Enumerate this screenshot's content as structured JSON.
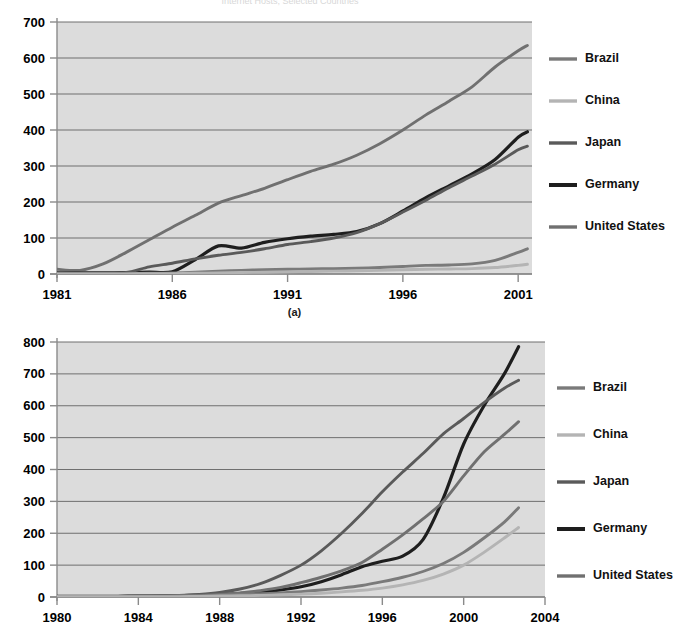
{
  "document": {
    "title_faint": "Internet Hosts, Selected Countries",
    "background_color": "#ffffff",
    "plot_background_color": "#dcdcdc",
    "gridline_color": "#6f6f6f"
  },
  "series_colors": {
    "Brazil": "#7a7a7a",
    "China": "#b4b4b4",
    "Japan": "#5a5a5a",
    "Germany": "#1e1e1e",
    "United States": "#707070"
  },
  "legend": {
    "entries": [
      {
        "label": "Brazil",
        "color": "#7a7a7a"
      },
      {
        "label": "China",
        "color": "#b4b4b4"
      },
      {
        "label": "Japan",
        "color": "#5a5a5a"
      },
      {
        "label": "Germany",
        "color": "#1e1e1e"
      },
      {
        "label": "United States",
        "color": "#707070"
      }
    ]
  },
  "chart_data": [
    {
      "id": "panel-a",
      "type": "line",
      "title": "",
      "caption": "(a)",
      "xlabel": "",
      "ylabel": "",
      "xlim": [
        1981,
        2001.6
      ],
      "ylim": [
        0,
        700
      ],
      "ytick_values": [
        0,
        100,
        200,
        300,
        400,
        500,
        600,
        700
      ],
      "ytick_labels": [
        "0",
        "100",
        "200",
        "300",
        "400",
        "500",
        "600",
        "700"
      ],
      "xtick_values": [
        1981,
        1986,
        1991,
        1996,
        2001
      ],
      "xtick_labels": [
        "1981",
        "1986",
        "1991",
        "1996",
        "2001"
      ],
      "grid": true,
      "legend_position": "right",
      "x": [
        1981,
        1982,
        1983,
        1984,
        1985,
        1986,
        1987,
        1988,
        1989,
        1990,
        1991,
        1992,
        1993,
        1994,
        1995,
        1996,
        1997,
        1998,
        1999,
        2000,
        2001,
        2001.4
      ],
      "series": [
        {
          "name": "United States",
          "color": "#707070",
          "values": [
            13,
            10,
            28,
            60,
            95,
            130,
            163,
            197,
            218,
            238,
            262,
            285,
            305,
            330,
            362,
            400,
            442,
            480,
            520,
            575,
            620,
            635
          ]
        },
        {
          "name": "Germany",
          "color": "#1e1e1e",
          "values": [
            3,
            3,
            3,
            4,
            5,
            6,
            40,
            78,
            72,
            88,
            98,
            105,
            110,
            118,
            140,
            175,
            212,
            245,
            278,
            318,
            380,
            395
          ]
        },
        {
          "name": "Japan",
          "color": "#5a5a5a",
          "values": [
            3,
            3,
            3,
            4,
            20,
            30,
            42,
            52,
            60,
            70,
            82,
            90,
            100,
            115,
            140,
            172,
            205,
            240,
            272,
            305,
            345,
            355
          ]
        },
        {
          "name": "Brazil",
          "color": "#7a7a7a",
          "values": [
            1,
            1,
            1,
            1,
            2,
            3,
            5,
            8,
            10,
            12,
            13,
            14,
            15,
            16,
            18,
            21,
            24,
            25,
            28,
            38,
            60,
            70
          ]
        },
        {
          "name": "China",
          "color": "#b4b4b4",
          "values": [
            0,
            0,
            0,
            0,
            1,
            1,
            2,
            3,
            4,
            5,
            6,
            7,
            8,
            9,
            10,
            12,
            13,
            14,
            15,
            18,
            24,
            27
          ]
        }
      ]
    },
    {
      "id": "panel-b",
      "type": "line",
      "title": "",
      "caption": "",
      "xlabel": "",
      "ylabel": "",
      "xlim": [
        1980,
        2004
      ],
      "ylim": [
        0,
        800
      ],
      "ytick_values": [
        0,
        100,
        200,
        300,
        400,
        500,
        600,
        700,
        800
      ],
      "ytick_labels": [
        "0",
        "100",
        "200",
        "300",
        "400",
        "500",
        "600",
        "700",
        "800"
      ],
      "xtick_values": [
        1980,
        1984,
        1988,
        1992,
        1996,
        2000,
        2004
      ],
      "xtick_labels": [
        "1980",
        "1984",
        "1988",
        "1992",
        "1996",
        "2000",
        "2004"
      ],
      "grid": true,
      "legend_position": "right",
      "x": [
        1980,
        1981,
        1982,
        1983,
        1984,
        1985,
        1986,
        1987,
        1988,
        1989,
        1990,
        1991,
        1992,
        1993,
        1994,
        1995,
        1996,
        1997,
        1998,
        1999,
        2000,
        2001,
        2002,
        2002.7
      ],
      "series": [
        {
          "name": "Germany",
          "color": "#1e1e1e",
          "values": [
            2,
            2,
            2,
            2,
            3,
            3,
            4,
            6,
            8,
            11,
            15,
            22,
            32,
            48,
            70,
            95,
            112,
            128,
            180,
            310,
            480,
            600,
            700,
            785
          ]
        },
        {
          "name": "Japan",
          "color": "#5a5a5a",
          "values": [
            2,
            2,
            2,
            2,
            3,
            4,
            5,
            8,
            14,
            25,
            42,
            68,
            100,
            145,
            200,
            262,
            330,
            392,
            450,
            512,
            560,
            610,
            655,
            680
          ]
        },
        {
          "name": "United States",
          "color": "#707070",
          "values": [
            2,
            2,
            2,
            2,
            3,
            3,
            4,
            5,
            8,
            13,
            20,
            30,
            45,
            62,
            82,
            108,
            150,
            195,
            245,
            300,
            380,
            455,
            510,
            550
          ]
        },
        {
          "name": "Brazil",
          "color": "#7a7a7a",
          "values": [
            2,
            2,
            2,
            2,
            2,
            2,
            3,
            4,
            6,
            8,
            10,
            13,
            17,
            22,
            28,
            36,
            48,
            62,
            80,
            105,
            140,
            185,
            235,
            280
          ]
        },
        {
          "name": "China",
          "color": "#b4b4b4",
          "values": [
            1,
            1,
            1,
            1,
            1,
            1,
            1,
            2,
            3,
            4,
            5,
            7,
            9,
            12,
            16,
            21,
            28,
            38,
            52,
            72,
            100,
            140,
            185,
            218
          ]
        }
      ]
    }
  ]
}
